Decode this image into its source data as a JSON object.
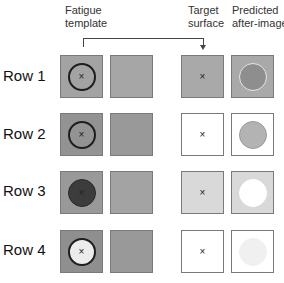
{
  "headers": {
    "fatigue_line1": "Fatigue",
    "fatigue_line2": "template",
    "target_line1": "Target",
    "target_line2": "surface",
    "predicted_line1": "Predicted",
    "predicted_line2": "after-image"
  },
  "fixation_mark": "×",
  "rows": [
    {
      "label": "Row 1",
      "fatigue_bg": "#a3a3a3",
      "fatigue_circle_fill": "transparent",
      "fatigue_circle_stroke": "#1e1e1e",
      "blank_bg": "#a6a6a6",
      "target_bg": "#a9a9a9",
      "predicted_bg": "#a9a9a9",
      "predicted_circle_fill": "#8e8e8e",
      "predicted_circle_stroke": "#e6e6e6"
    },
    {
      "label": "Row 2",
      "fatigue_bg": "#939393",
      "fatigue_circle_fill": "transparent",
      "fatigue_circle_stroke": "#1e1e1e",
      "blank_bg": "#999999",
      "target_bg": "#ffffff",
      "predicted_bg": "#ffffff",
      "predicted_circle_fill": "#b3b3b3",
      "predicted_circle_stroke": "#9a9a9a"
    },
    {
      "label": "Row 3",
      "fatigue_bg": "#999999",
      "fatigue_circle_fill": "#3c3c3c",
      "fatigue_circle_stroke": "#2a2a2a",
      "blank_bg": "#a3a3a3",
      "target_bg": "#d9d9d9",
      "predicted_bg": "#d9d9d9",
      "predicted_circle_fill": "#ffffff",
      "predicted_circle_stroke": "#ffffff"
    },
    {
      "label": "Row 4",
      "fatigue_bg": "#8f8f8f",
      "fatigue_circle_fill": "#ececec",
      "fatigue_circle_stroke": "#1e1e1e",
      "blank_bg": "#999999",
      "target_bg": "#ffffff",
      "predicted_bg": "#ffffff",
      "predicted_circle_fill": "#f0f0f0",
      "predicted_circle_stroke": "#f0f0f0"
    }
  ]
}
